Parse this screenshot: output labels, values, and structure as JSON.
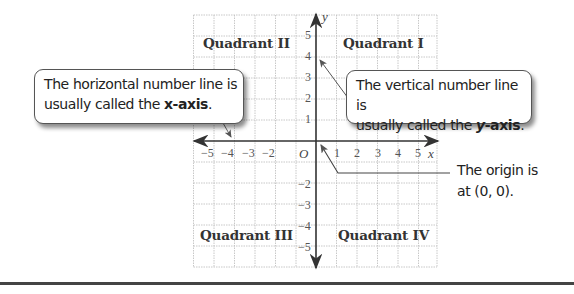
{
  "diagram": {
    "quadrants": [
      {
        "id": "I",
        "label": "Quadrant I"
      },
      {
        "id": "II",
        "label": "Quadrant II"
      },
      {
        "id": "III",
        "label": "Quadrant III"
      },
      {
        "id": "IV",
        "label": "Quadrant IV"
      }
    ],
    "axes": {
      "x_name": "x",
      "y_name": "y",
      "origin_label": "O",
      "x_ticks": [
        "−5",
        "−4",
        "−3",
        "−2",
        "1",
        "2",
        "3",
        "4",
        "5"
      ],
      "y_ticks_pos": [
        "5",
        "4",
        "3",
        "2",
        "1"
      ],
      "y_ticks_neg": [
        "−2",
        "−3",
        "−4",
        "−5"
      ]
    },
    "callouts": {
      "x_axis": {
        "text_line1": "The horizontal number line is",
        "text_line2_prefix": "usually called the ",
        "emphasis": "x-axis",
        "suffix": "."
      },
      "y_axis": {
        "text_line1": "The vertical number line is",
        "text_line2_prefix": "usually called the ",
        "emphasis_var": "y",
        "emphasis_rest": "-axis",
        "suffix": "."
      },
      "origin": {
        "line1": "The origin is",
        "line2": "at (0, 0)."
      }
    },
    "colors": {
      "grid": "#b9b9b9",
      "axis": "#333333",
      "text": "#222222",
      "rule": "#444444"
    }
  }
}
